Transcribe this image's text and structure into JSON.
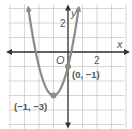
{
  "chart_data": {
    "type": "line",
    "title": "",
    "xlabel": "x",
    "ylabel": "y",
    "origin_label": "O",
    "xlim": [
      -4,
      4
    ],
    "ylim": [
      -5,
      3
    ],
    "grid": true,
    "tick_labels": {
      "x": [
        "2"
      ],
      "y": [
        "2"
      ]
    },
    "series": [
      {
        "name": "parabola",
        "equation": "y = 2(x+1)^2 - 3",
        "x": [
          -2.73,
          -2,
          -1.5,
          -1,
          -0.5,
          0,
          0.73
        ],
        "y": [
          3,
          -1,
          -2.5,
          -3,
          -2.5,
          -1,
          3
        ]
      }
    ],
    "points": [
      {
        "x": -1,
        "y": -3,
        "label": "(−1, −3)"
      },
      {
        "x": 0,
        "y": -1,
        "label": "(0, −1)"
      }
    ]
  },
  "colors": {
    "grid": "#cccccc",
    "axis": "#333333",
    "curve": "#8a8a8a",
    "point": "#8a8a8a",
    "label": "#555555"
  }
}
